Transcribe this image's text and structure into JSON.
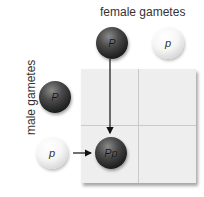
{
  "labels": {
    "female": "female gametes",
    "male": "male gametes"
  },
  "female_gametes": [
    {
      "allele": "P",
      "tone": "dark"
    },
    {
      "allele": "p",
      "tone": "light"
    }
  ],
  "male_gametes": [
    {
      "allele": "P",
      "tone": "dark"
    },
    {
      "allele": "p",
      "tone": "light"
    }
  ],
  "punnett_square": {
    "rows": 2,
    "cols": 2,
    "filled_cells": [
      {
        "row": 1,
        "col": 0,
        "genotype": "Pp",
        "tone": "dark"
      }
    ]
  },
  "colors": {
    "grid_bg": "#eeeeef",
    "grid_line": "#c9c9cc",
    "arrow": "#111111"
  }
}
